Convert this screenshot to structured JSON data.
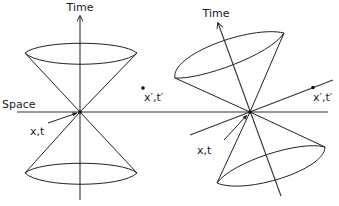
{
  "diagram": {
    "left_panel": {
      "time_label": "Time",
      "space_label": "Space",
      "event_label": "x,t",
      "other_event_label": "x′,t′"
    },
    "right_panel": {
      "time_label": "Time",
      "event_label": "x,t",
      "other_event_label": "x′,t′"
    },
    "colors": {
      "line": "#222222",
      "background": "#ffffff"
    }
  }
}
